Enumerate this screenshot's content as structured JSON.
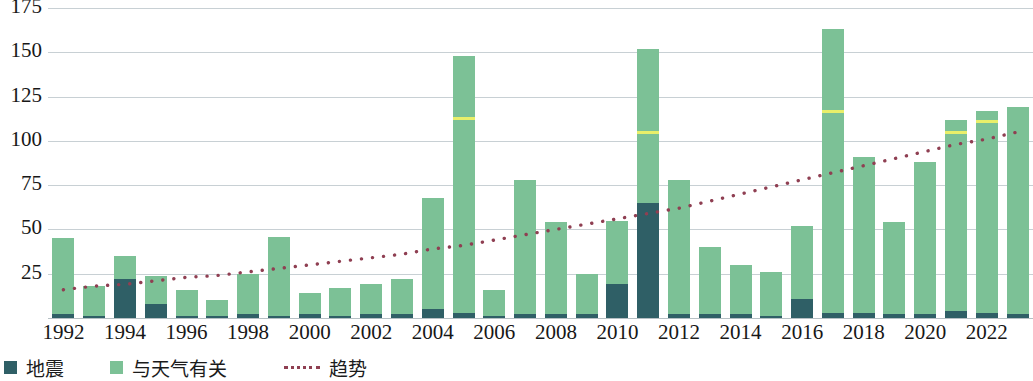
{
  "chart_data": {
    "type": "bar",
    "title": "",
    "subtitle": "",
    "xlabel": "",
    "ylabel": "",
    "ylim": [
      0,
      175
    ],
    "yticks": [
      25,
      50,
      75,
      100,
      125,
      150,
      175
    ],
    "ytick_labels": [
      "25",
      "50",
      "75",
      "100",
      "125",
      "150",
      "175"
    ],
    "grid": true,
    "stacked": true,
    "legend_position": "bottom-left",
    "x": [
      1992,
      1993,
      1994,
      1995,
      1996,
      1997,
      1998,
      1999,
      2000,
      2001,
      2002,
      2003,
      2004,
      2005,
      2006,
      2007,
      2008,
      2009,
      2010,
      2011,
      2012,
      2013,
      2014,
      2015,
      2016,
      2017,
      2018,
      2019,
      2020,
      2021,
      2022,
      2023
    ],
    "xtick_labels": [
      "1992",
      "1994",
      "1996",
      "1998",
      "2000",
      "2002",
      "2004",
      "2006",
      "2008",
      "2010",
      "2012",
      "2014",
      "2016",
      "2018",
      "2020",
      "2022"
    ],
    "xticks": [
      1992,
      1994,
      1996,
      1998,
      2000,
      2002,
      2004,
      2006,
      2008,
      2010,
      2012,
      2014,
      2016,
      2018,
      2020,
      2022
    ],
    "series": [
      {
        "name": "地震",
        "key": "earthquake",
        "color": "#2f5f66",
        "values": [
          2,
          1,
          22,
          8,
          1,
          1,
          2,
          1,
          2,
          1,
          2,
          2,
          5,
          3,
          1,
          2,
          2,
          2,
          19,
          65,
          2,
          2,
          2,
          1,
          11,
          3,
          3,
          2,
          2,
          4,
          3,
          2
        ]
      },
      {
        "name": "与天气有关",
        "key": "weather",
        "color": "#7cc196",
        "values": [
          43,
          17,
          13,
          16,
          15,
          9,
          23,
          45,
          12,
          16,
          17,
          20,
          63,
          145,
          15,
          76,
          52,
          23,
          36,
          87,
          76,
          38,
          28,
          25,
          41,
          160,
          88,
          52,
          86,
          108,
          114,
          117
        ]
      }
    ],
    "totals": [
      45,
      18,
      35,
      24,
      16,
      10,
      25,
      46,
      14,
      17,
      19,
      22,
      68,
      148,
      16,
      78,
      54,
      25,
      55,
      152,
      78,
      40,
      30,
      26,
      52,
      163,
      91,
      54,
      88,
      112,
      117,
      119
    ],
    "highlight_markers": {
      "label": "yellow-segment-marker",
      "color": "#e9ef6a",
      "points": [
        {
          "year": 2005,
          "value": 112
        },
        {
          "year": 2011,
          "value": 104
        },
        {
          "year": 2017,
          "value": 116
        },
        {
          "year": 2021,
          "value": 104
        },
        {
          "year": 2022,
          "value": 110
        }
      ]
    },
    "trend": {
      "name": "趋势",
      "color": "#8f3f52",
      "style": "dotted",
      "values": [
        16,
        18,
        19,
        21,
        23,
        24,
        26,
        28,
        30,
        32,
        34,
        36,
        39,
        41,
        44,
        47,
        50,
        53,
        56,
        59,
        62,
        66,
        70,
        74,
        78,
        82,
        86,
        90,
        94,
        98,
        101,
        105
      ]
    }
  },
  "legend": {
    "items": [
      {
        "label": "地震",
        "marker": "square",
        "color": "#2f5f66"
      },
      {
        "label": "与天气有关",
        "marker": "square",
        "color": "#7cc196"
      },
      {
        "label": "趋势",
        "marker": "dotted-line",
        "color": "#8f3f52"
      }
    ]
  }
}
